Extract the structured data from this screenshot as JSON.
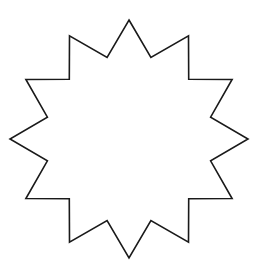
{
  "shape": {
    "type": "star",
    "points": 12,
    "inner_to_outer_ratio": 0.71,
    "fill": "#ffffff",
    "stroke": "#1a1a1a",
    "orientation": "point-up"
  }
}
